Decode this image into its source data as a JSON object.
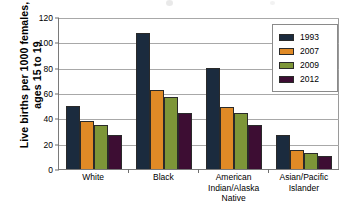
{
  "chart_data": {
    "type": "bar",
    "title": "",
    "subtitle": "",
    "xlabel": "",
    "ylabel": "Live births per 1000 females, ages 15 to 19",
    "ylim": [
      0,
      120
    ],
    "yticks": [
      0,
      20,
      40,
      60,
      80,
      100,
      120
    ],
    "ytick_labels": [
      "0",
      "20",
      "40",
      "60",
      "80",
      "100",
      "120"
    ],
    "grid": "horizontal",
    "legend_position": "top-right",
    "categories": [
      "White",
      "Black",
      "American Indian/Alaska Native",
      "Asian/Pacific Islander"
    ],
    "category_label_lines": [
      [
        "White"
      ],
      [
        "Black"
      ],
      [
        "American",
        "Indian/Alaska",
        "Native"
      ],
      [
        "Asian/Pacific",
        "Islander"
      ]
    ],
    "series": [
      {
        "name": "1993",
        "color": "#1b2b3e",
        "values": [
          50,
          107,
          80,
          27
        ]
      },
      {
        "name": "2007",
        "color": "#e08a26",
        "values": [
          38,
          62,
          49,
          15
        ]
      },
      {
        "name": "2009",
        "color": "#7d9638",
        "values": [
          35,
          57,
          44,
          13
        ]
      },
      {
        "name": "2012",
        "color": "#3d0d33",
        "values": [
          27,
          44,
          35,
          10
        ]
      }
    ]
  },
  "axis": {
    "line_color": "#7a7a7a",
    "grid_color": "#a8a8a8"
  }
}
